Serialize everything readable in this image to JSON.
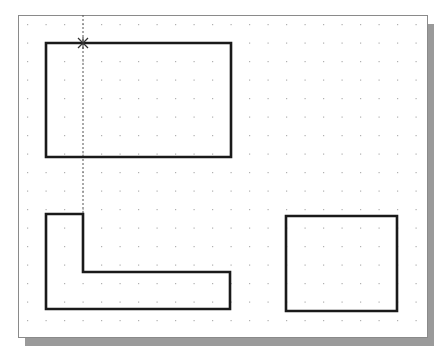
{
  "canvas": {
    "x": 18,
    "y": 15,
    "width": 409,
    "height": 322,
    "background": "#ffffff",
    "border_color": "#8a8a8a",
    "shadow_color": "#9a9a9a",
    "shadow_offset": 7
  },
  "grid": {
    "origin_x": 27,
    "origin_y": 24,
    "spacing": 18.5,
    "cols": 22,
    "rows": 17,
    "dot_color": "#b0b0b0"
  },
  "stroke": {
    "color": "#1a1a1a",
    "width": 2.6
  },
  "shapes": [
    {
      "name": "top-rectangle",
      "type": "polygon",
      "points": [
        [
          46,
          43
        ],
        [
          231,
          43
        ],
        [
          231,
          157
        ],
        [
          46,
          157
        ]
      ]
    },
    {
      "name": "l-shape",
      "type": "polygon",
      "points": [
        [
          46,
          214
        ],
        [
          83,
          214
        ],
        [
          83,
          272
        ],
        [
          230,
          272
        ],
        [
          230,
          309
        ],
        [
          46,
          309
        ]
      ]
    },
    {
      "name": "right-rectangle",
      "type": "polygon",
      "points": [
        [
          286,
          216
        ],
        [
          397,
          216
        ],
        [
          397,
          311
        ],
        [
          286,
          311
        ]
      ]
    }
  ],
  "tracking_line": {
    "x": 83,
    "y1": 15,
    "y2": 214,
    "color": "#555555",
    "dash": "2,2"
  },
  "cursor": {
    "x": 83,
    "y": 43,
    "symbol": "crosshair-snap-marker",
    "color": "#333333"
  }
}
